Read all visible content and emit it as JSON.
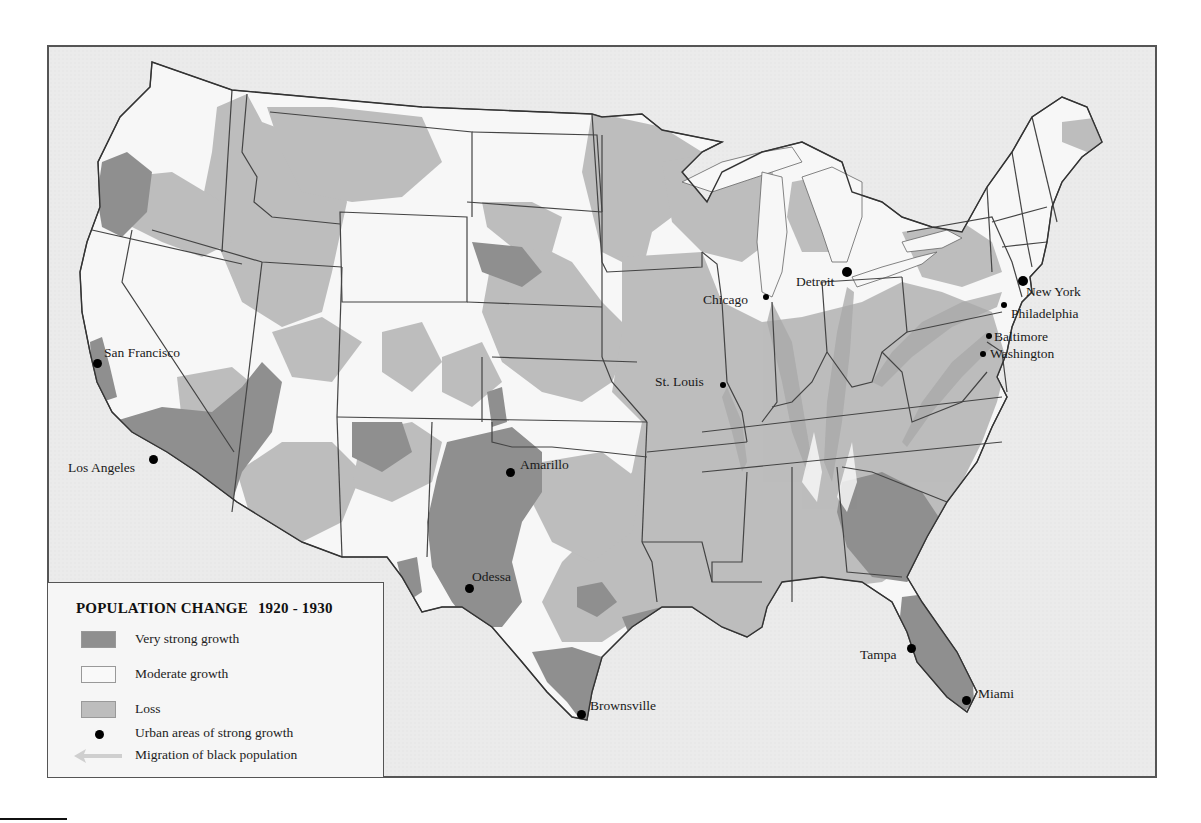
{
  "legend": {
    "title": "POPULATION CHANGE",
    "years": "1920 - 1930",
    "items": [
      {
        "key": "very-strong-growth",
        "label": "Very strong growth",
        "swatch": "swatch",
        "color": "#8f8f8f"
      },
      {
        "key": "moderate-growth",
        "label": "Moderate growth",
        "swatch": "swatch",
        "color": "#f7f7f7"
      },
      {
        "key": "loss",
        "label": "Loss",
        "swatch": "swatch",
        "color": "#bdbdbd"
      },
      {
        "key": "urban-growth",
        "label": "Urban areas of strong growth",
        "swatch": "dot",
        "color": "#000000"
      },
      {
        "key": "migration",
        "label": "Migration of black population",
        "swatch": "arrow",
        "color": "#c8c8c8"
      }
    ]
  },
  "colors": {
    "background_sea": "#ebebeb",
    "very_strong_growth": "#8f8f8f",
    "moderate_growth": "#f7f7f7",
    "loss": "#bdbdbd",
    "border": "#444444",
    "migration_arrow": "#a9a9a9"
  },
  "cities": [
    {
      "name": "San Francisco",
      "x": 97,
      "y": 363,
      "dot": 9,
      "lx": 104,
      "ly": 346
    },
    {
      "name": "Los Angeles",
      "x": 153,
      "y": 460,
      "dot": 9,
      "lx": 68,
      "ly": 460
    },
    {
      "name": "Amarillo",
      "x": 510,
      "y": 473,
      "dot": 9,
      "lx": 520,
      "ly": 458
    },
    {
      "name": "Odessa",
      "x": 469,
      "y": 589,
      "dot": 9,
      "lx": 472,
      "ly": 569
    },
    {
      "name": "Brownsville",
      "x": 581,
      "y": 715,
      "dot": 9,
      "lx": 590,
      "ly": 699
    },
    {
      "name": "St. Louis",
      "x": 722,
      "y": 385,
      "dot": 6,
      "lx": 655,
      "ly": 375
    },
    {
      "name": "Chicago",
      "x": 766,
      "y": 297,
      "dot": 6,
      "lx": 703,
      "ly": 293
    },
    {
      "name": "Detroit",
      "x": 847,
      "y": 273,
      "dot": 10,
      "lx": 796,
      "ly": 275
    },
    {
      "name": "New York",
      "x": 1023,
      "y": 282,
      "dot": 10,
      "lx": 1026,
      "ly": 284
    },
    {
      "name": "Philadelphia",
      "x": 1004,
      "y": 305,
      "dot": 6,
      "lx": 1011,
      "ly": 306
    },
    {
      "name": "Baltimore",
      "x": 989,
      "y": 336,
      "dot": 6,
      "lx": 994,
      "ly": 330
    },
    {
      "name": "Washington",
      "x": 983,
      "y": 354,
      "dot": 6,
      "lx": 990,
      "ly": 347
    },
    {
      "name": "Tampa",
      "x": 911,
      "y": 649,
      "dot": 9,
      "lx": 860,
      "ly": 648
    },
    {
      "name": "Miami",
      "x": 966,
      "y": 700,
      "dot": 9,
      "lx": 978,
      "ly": 687
    }
  ]
}
